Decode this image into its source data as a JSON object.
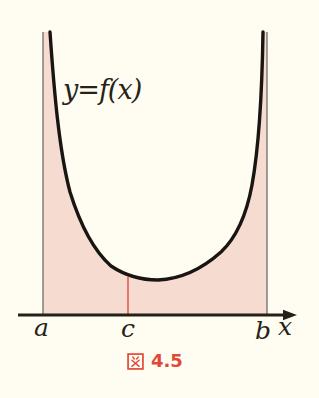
{
  "figure": {
    "curve_label": "y=f(x)",
    "x_axis": {
      "label": "x",
      "tick_a": "a",
      "tick_c": "c",
      "tick_b": "b"
    },
    "caption": {
      "prefix": "図",
      "number": "4.5",
      "full": "図 4.5"
    },
    "colors": {
      "background": "#fffdf1",
      "shaded_region": "#f6dcd0",
      "curve": "#181512",
      "axis": "#24211b",
      "boundary_lines": "#63635c",
      "c_marker_line": "#e2483a",
      "caption_red": "#e2483a"
    }
  }
}
